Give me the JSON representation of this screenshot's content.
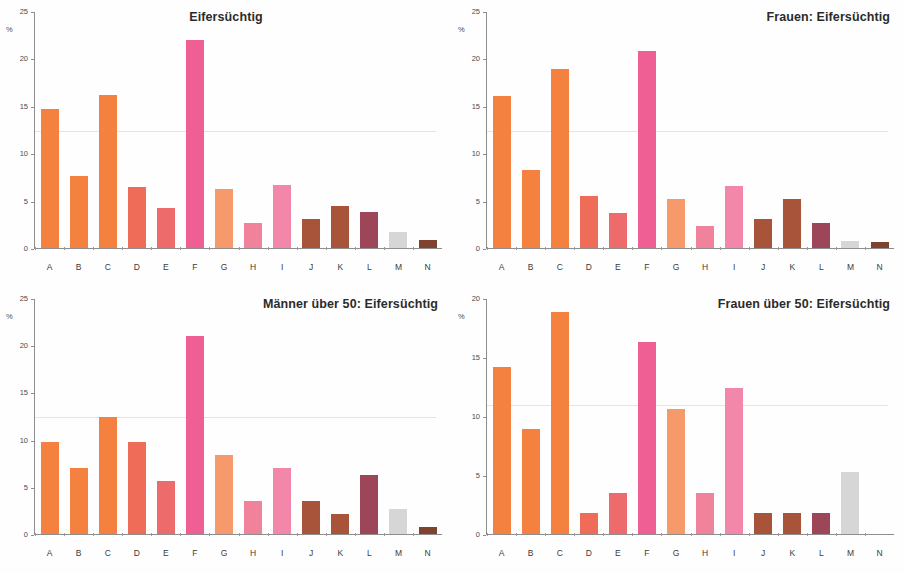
{
  "figure": {
    "background_color": "#ffffff",
    "axis_color": "#8d8d8d",
    "text_color": "#2b2b2b",
    "panel_count": 4
  },
  "palette": {
    "A": "#F4813F",
    "B": "#F4813F",
    "C": "#F4813F",
    "D": "#EE6C58",
    "E": "#EE6B6B",
    "F": "#EF5F93",
    "G": "#F79A6B",
    "H": "#F0829C",
    "I": "#F287A9",
    "J": "#A8543A",
    "K": "#A8543A",
    "L": "#9E4659",
    "M": "#D6D6D6",
    "N": "#7E4430"
  },
  "chart_data": [
    {
      "type": "bar",
      "panel": "top-left",
      "title": "Eifersüchtig",
      "title_align": "center",
      "xlabel": "",
      "ylabel": "%",
      "ylim": [
        0,
        25
      ],
      "yticks": [
        0,
        5,
        10,
        15,
        20,
        25
      ],
      "grid": false,
      "legend": "none",
      "categories": [
        "A",
        "B",
        "C",
        "D",
        "E",
        "F",
        "G",
        "H",
        "I",
        "J",
        "K",
        "L",
        "M",
        "N"
      ],
      "values": [
        14.7,
        7.6,
        16.2,
        6.5,
        4.2,
        22.0,
        6.3,
        2.7,
        6.7,
        3.1,
        4.4,
        3.8,
        1.7,
        0.8
      ]
    },
    {
      "type": "bar",
      "panel": "top-right",
      "title": "Frauen: Eifersüchtig",
      "title_align": "right",
      "xlabel": "",
      "ylabel": "%",
      "ylim": [
        0,
        25
      ],
      "yticks": [
        0,
        5,
        10,
        15,
        20,
        25
      ],
      "grid": false,
      "legend": "none",
      "categories": [
        "A",
        "B",
        "C",
        "D",
        "E",
        "F",
        "G",
        "H",
        "I",
        "J",
        "K",
        "L",
        "M",
        "N"
      ],
      "values": [
        16.1,
        8.3,
        19.0,
        5.5,
        3.7,
        20.9,
        5.2,
        2.3,
        6.6,
        3.1,
        5.2,
        2.6,
        0.7,
        0.6
      ]
    },
    {
      "type": "bar",
      "panel": "bottom-left",
      "title": "Männer über 50: Eifersüchtig",
      "title_align": "right",
      "xlabel": "",
      "ylabel": "%",
      "ylim": [
        0,
        25
      ],
      "yticks": [
        0,
        5,
        10,
        15,
        20,
        25
      ],
      "grid": false,
      "legend": "none",
      "categories": [
        "A",
        "B",
        "C",
        "D",
        "E",
        "F",
        "G",
        "H",
        "I",
        "J",
        "K",
        "L",
        "M",
        "N"
      ],
      "values": [
        9.8,
        7.0,
        12.5,
        9.8,
        5.6,
        21.1,
        8.4,
        3.5,
        7.0,
        3.5,
        2.1,
        6.3,
        2.7,
        0.7
      ]
    },
    {
      "type": "bar",
      "panel": "bottom-right",
      "title": "Frauen über 50: Eifersüchtig",
      "title_align": "right",
      "xlabel": "",
      "ylabel": "%",
      "ylim": [
        0,
        20
      ],
      "yticks": [
        0,
        5,
        10,
        15,
        20
      ],
      "grid": false,
      "legend": "none",
      "categories": [
        "A",
        "B",
        "C",
        "D",
        "E",
        "F",
        "G",
        "H",
        "I",
        "J",
        "K",
        "L",
        "M",
        "N"
      ],
      "values": [
        14.2,
        8.9,
        18.9,
        1.8,
        3.5,
        16.3,
        10.6,
        3.5,
        12.4,
        1.8,
        1.8,
        1.8,
        5.3,
        0.0
      ]
    }
  ]
}
